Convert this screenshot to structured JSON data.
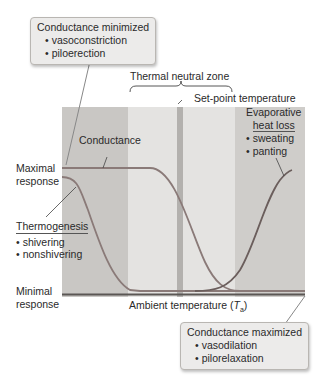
{
  "diagram": {
    "top_box": {
      "title": "Conductance minimized",
      "items": [
        "vasoconstriction",
        "piloerection"
      ]
    },
    "bottom_box": {
      "title": "Conductance maximized",
      "items": [
        "vasodilation",
        "pilorelaxation"
      ]
    },
    "thermal_neutral_zone": "Thermal neutral zone",
    "set_point": "Set-point temperature",
    "conductance": "Conductance",
    "maximal_response": [
      "Maximal",
      "response"
    ],
    "minimal_response": [
      "Minimal",
      "response"
    ],
    "thermogenesis": {
      "title": "Thermogenesis",
      "items": [
        "shivering",
        "nonshivering"
      ]
    },
    "evaporative": {
      "title": [
        "Evaporative",
        "heat loss"
      ],
      "items": [
        "sweating",
        "panting"
      ]
    },
    "x_axis": {
      "label_prefix": "Ambient temperature (",
      "symbol": "T",
      "subscript": "a",
      "label_suffix": ")"
    },
    "colors": {
      "dark_zone": "#c9c7c4",
      "light_zone": "#e4e3e1",
      "set_point_bar": "#b3b1ae",
      "curve": "#8a7a78",
      "axis": "#5b5754"
    }
  }
}
